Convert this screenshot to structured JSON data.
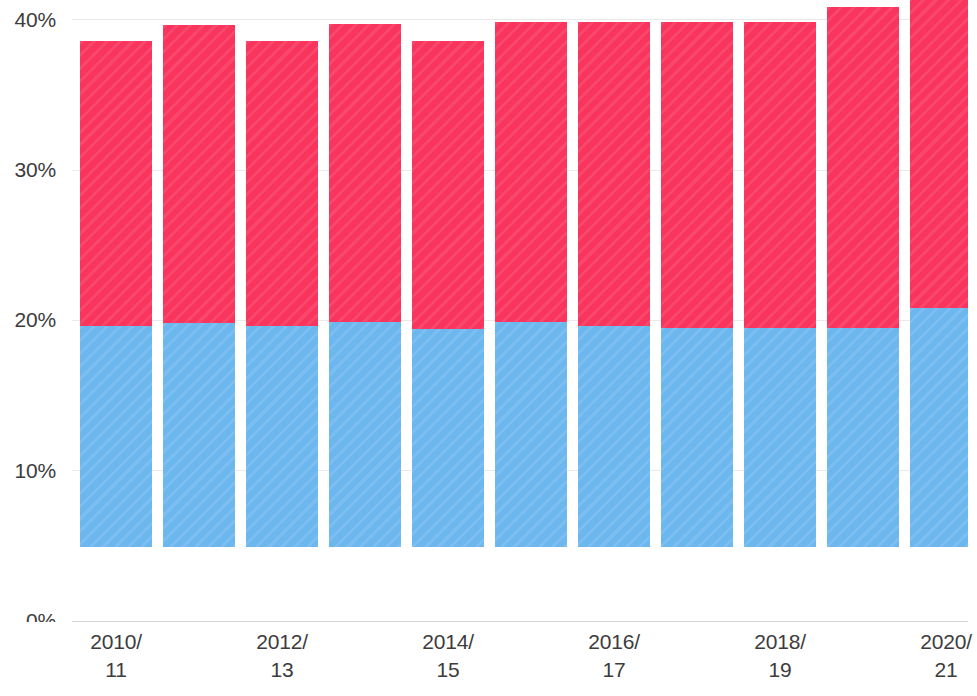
{
  "chart_data": {
    "type": "bar",
    "subtype": "stacked-vertical",
    "title": "",
    "subtitle": "",
    "xlabel": "",
    "ylabel": "",
    "ylim": [
      0,
      40
    ],
    "y_axis_unit": "%",
    "grid": true,
    "grid_axis": "y",
    "legend": "none",
    "bars_clipped_at_top": true,
    "clipped_note": "Final bar (2020/21) extends above the visible 40% axis limit",
    "yticks": [
      0,
      10,
      20,
      30,
      40
    ],
    "ytick_labels": [
      "0%",
      "10%",
      "20%",
      "30%",
      "40%"
    ],
    "categories": [
      "2010/11",
      "2011/12",
      "2012/13",
      "2013/14",
      "2014/15",
      "2015/16",
      "2016/17",
      "2017/18",
      "2018/19",
      "2019/20",
      "2020/21"
    ],
    "xtick_labels_shown": [
      {
        "index": 0,
        "line1": "2010/",
        "line2": "11"
      },
      {
        "index": 2,
        "line1": "2012/",
        "line2": "13"
      },
      {
        "index": 4,
        "line1": "2014/",
        "line2": "15"
      },
      {
        "index": 6,
        "line1": "2016/",
        "line2": "17"
      },
      {
        "index": 8,
        "line1": "2018/",
        "line2": "19"
      },
      {
        "index": 10,
        "line1": "2020/",
        "line2": "21"
      }
    ],
    "series": [
      {
        "name": "lower-segment",
        "color": "#6db7ef",
        "stack_position": "bottom",
        "values": [
          14.7,
          14.9,
          14.7,
          15.0,
          14.5,
          15.0,
          14.7,
          14.6,
          14.6,
          14.6,
          15.9
        ]
      },
      {
        "name": "upper-segment",
        "color": "#f9355e",
        "stack_position": "top",
        "values": [
          19.0,
          19.8,
          19.0,
          19.8,
          19.2,
          19.9,
          20.2,
          20.3,
          20.3,
          21.3,
          25.7
        ]
      }
    ],
    "totals": [
      33.7,
      34.7,
      33.7,
      34.8,
      33.7,
      34.9,
      34.9,
      34.9,
      34.9,
      35.9,
      41.6
    ]
  },
  "axis": {
    "y_tick_0": "0%",
    "y_tick_10": "10%",
    "y_tick_20": "20%",
    "y_tick_30": "30%",
    "y_tick_40": "40%"
  },
  "colors": {
    "upper_segment": "#f9355e",
    "lower_segment": "#6db7ef",
    "gridline": "#e9e9ea",
    "axis_line": "#d8d8da",
    "text": "#3c3c3c",
    "background": "#ffffff"
  }
}
